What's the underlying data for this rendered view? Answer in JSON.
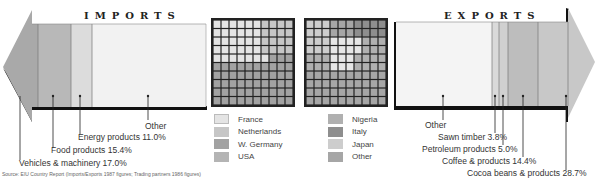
{
  "chart_data": [
    {
      "type": "bar",
      "subtype": "stacked-arrow",
      "title": "IMPORTS",
      "direction": "left",
      "categories": [
        "Vehicles & machinery",
        "Food products",
        "Energy products",
        "Other"
      ],
      "values": [
        17.0,
        15.4,
        11.0,
        56.6
      ],
      "unit": "%",
      "labels": [
        "Vehicles & machinery 17.0%",
        "Food products 15.4%",
        "Energy products 11.0%",
        "Other"
      ],
      "colors": [
        "#a9a9a9",
        "#b8b8b8",
        "#dcdcdc",
        "#f2f2f2"
      ]
    },
    {
      "type": "heatmap",
      "subtype": "10x10 waffle",
      "title": "Import trading partners",
      "legend": [
        "France",
        "Netherlands",
        "W. Germany",
        "USA"
      ],
      "colors": [
        "#e4e4e4",
        "#c6c6c6",
        "#a2a2a2",
        "#b4b4b4"
      ]
    },
    {
      "type": "heatmap",
      "subtype": "10x10 waffle",
      "title": "Export trading partners",
      "legend": [
        "Nigeria",
        "Italy",
        "Japan",
        "Other"
      ],
      "colors": [
        "#b0b0b0",
        "#8e8e8e",
        "#cdcdcd",
        "#a6a6a6"
      ]
    },
    {
      "type": "bar",
      "subtype": "stacked-arrow",
      "title": "EXPORTS",
      "direction": "right",
      "categories": [
        "Other",
        "Sawn timber",
        "Petroleum products",
        "Coffee & products",
        "Cocoa beans & products"
      ],
      "values": [
        48.1,
        3.8,
        5.0,
        14.4,
        28.7
      ],
      "unit": "%",
      "labels": [
        "Other",
        "Sawn timber 3.8%",
        "Petroleum products 5.0%",
        "Coffee & products 14.4%",
        "Cocoa beans & products 28.7%"
      ],
      "colors": [
        "#f4f4f4",
        "#dadada",
        "#d0d0d0",
        "#bdbdbd",
        "#c8c8c8"
      ]
    }
  ],
  "imports": {
    "title": "IMPORTS",
    "labels": {
      "vehicles": "Vehicles & machinery 17.0%",
      "food": "Food products 15.4%",
      "energy": "Energy products 11.0%",
      "other": "Other"
    }
  },
  "exports": {
    "title": "EXPORTS",
    "labels": {
      "other": "Other",
      "timber": "Sawn timber 3.8%",
      "petroleum": "Petroleum products 5.0%",
      "coffee": "Coffee & products 14.4%",
      "cocoa": "Cocoa beans & products 28.7%"
    }
  },
  "import_legend": [
    "France",
    "Netherlands",
    "W. Germany",
    "USA"
  ],
  "export_legend": [
    "Nigeria",
    "Italy",
    "Japan",
    "Other"
  ],
  "source": "Source: EIU Country Report (Imports/Exports 1987 figures; Trading partners 1986 figures)"
}
